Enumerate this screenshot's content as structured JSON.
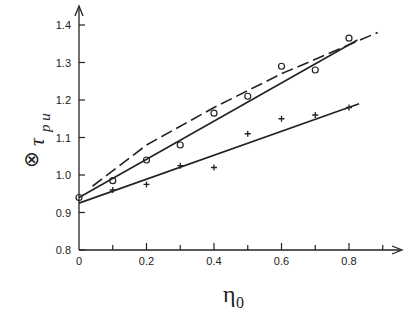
{
  "chart_data": {
    "type": "scatter",
    "title": "",
    "xlabel": "η0",
    "ylabel": "τpu⊗",
    "xlim": [
      0,
      0.9
    ],
    "ylim": [
      0.8,
      1.45
    ],
    "x_ticks": [
      "0",
      "0.2",
      "0.4",
      "0.6",
      "0.8"
    ],
    "y_ticks": [
      "0.8",
      "0.9",
      "1.0",
      "1.1",
      "1.2",
      "1.3",
      "1.4"
    ],
    "grid": false,
    "legend": null,
    "series": [
      {
        "name": "circles",
        "marker": "o",
        "x": [
          0,
          0.1,
          0.2,
          0.3,
          0.4,
          0.5,
          0.6,
          0.7,
          0.8
        ],
        "y": [
          0.94,
          0.985,
          1.04,
          1.08,
          1.165,
          1.21,
          1.29,
          1.28,
          1.365
        ]
      },
      {
        "name": "crosses",
        "marker": "+",
        "x": [
          0.1,
          0.2,
          0.3,
          0.4,
          0.5,
          0.6,
          0.7,
          0.8
        ],
        "y": [
          0.96,
          0.975,
          1.025,
          1.02,
          1.11,
          1.15,
          1.16,
          1.18
        ]
      },
      {
        "name": "upper-fit",
        "style": "solid",
        "x": [
          0,
          0.825
        ],
        "y": [
          0.94,
          1.36
        ]
      },
      {
        "name": "lower-fit",
        "style": "solid",
        "x": [
          0,
          0.83
        ],
        "y": [
          0.925,
          1.19
        ]
      },
      {
        "name": "dashed-curve",
        "style": "dashed",
        "x": [
          0.04,
          0.2,
          0.4,
          0.6,
          0.885
        ],
        "y": [
          0.97,
          1.08,
          1.18,
          1.27,
          1.38
        ]
      }
    ]
  },
  "labels": {
    "y_main": "τ",
    "y_sub": "p u",
    "y_sup": "⊗",
    "x_main": "η",
    "x_sub": "0"
  }
}
